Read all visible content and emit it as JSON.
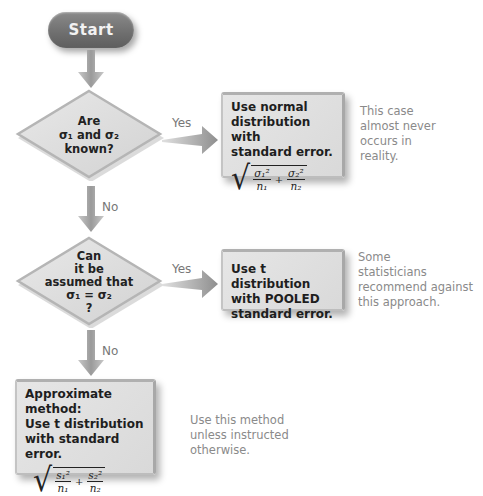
{
  "flowchart": {
    "start": {
      "label": "Start"
    },
    "decision1": {
      "lines": [
        "Are",
        "σ₁ and σ₂",
        "known?"
      ],
      "yes_label": "Yes",
      "no_label": "No"
    },
    "result1": {
      "lines": [
        "Use normal",
        "distribution with",
        "standard error."
      ],
      "formula": {
        "num1": "σ₁²",
        "den1": "n₁",
        "plus": "+",
        "num2": "σ₂²",
        "den2": "n₂"
      },
      "note": [
        "This case",
        "almost never",
        "occurs in",
        "reality."
      ]
    },
    "decision2": {
      "lines": [
        "Can",
        "it be",
        "assumed that",
        "σ₁ = σ₂",
        "?"
      ],
      "yes_label": "Yes",
      "no_label": "No"
    },
    "result2": {
      "lines": [
        "Use t distribution",
        "with POOLED",
        "standard error."
      ],
      "note": [
        "Some",
        "statisticians",
        "recommend against",
        "this approach."
      ]
    },
    "result3": {
      "lines": [
        "Approximate method:",
        "Use t distribution",
        "with standard error."
      ],
      "formula": {
        "num1": "s₁²",
        "den1": "n₁",
        "plus": "+",
        "num2": "s₂²",
        "den2": "n₂"
      },
      "note": [
        "Use this method",
        "unless instructed",
        "otherwise."
      ]
    },
    "colors": {
      "start_fill": "#6e6e6e",
      "box_fill": "#e0e0e0",
      "arrow_fill": "#9a9a9a",
      "note_text": "#8a8a8a"
    }
  }
}
